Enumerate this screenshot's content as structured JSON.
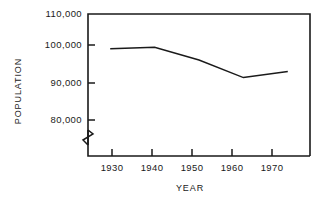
{
  "chart_data": {
    "type": "line",
    "title": "",
    "xlabel": "YEAR",
    "ylabel": "POPULATION",
    "x": [
      1930,
      1940,
      1950,
      1960,
      1970
    ],
    "values": [
      100200,
      100600,
      97000,
      92000,
      93700
    ],
    "series": [
      {
        "name": "Population",
        "values": [
          100200,
          100600,
          97000,
          92000,
          93700
        ]
      }
    ],
    "categories": [
      "1930",
      "1940",
      "1950",
      "1960",
      "1970"
    ],
    "xtick_labels": [
      "1930",
      "1940",
      "1950",
      "1960",
      "1970"
    ],
    "ytick_labels": [
      "80,000",
      "90,000",
      "100,000",
      "110,000"
    ],
    "ytick_values": [
      80000,
      90000,
      100000,
      110000
    ],
    "xlim": [
      1925,
      1975
    ],
    "ylim": [
      80000,
      110000
    ],
    "grid": false,
    "legend": false,
    "legend_position": "none",
    "y_axis_break": true,
    "y_axis_break_note": "zigzag break below 80,000",
    "line_color": "#1a1a1a",
    "axis_color": "#1a1a1a",
    "background_color": "#ffffff",
    "markers": false
  },
  "axes": {
    "y_title": "POPULATION",
    "x_title": "YEAR",
    "y_ticks": [
      {
        "label": "110,000",
        "value": 110000
      },
      {
        "label": "100,000",
        "value": 100000
      },
      {
        "label": "90,000",
        "value": 90000
      },
      {
        "label": "80,000",
        "value": 80000
      }
    ],
    "x_ticks": [
      {
        "label": "1930",
        "value": 1930
      },
      {
        "label": "1940",
        "value": 1940
      },
      {
        "label": "1950",
        "value": 1950
      },
      {
        "label": "1960",
        "value": 1960
      },
      {
        "label": "1970",
        "value": 1970
      }
    ]
  }
}
